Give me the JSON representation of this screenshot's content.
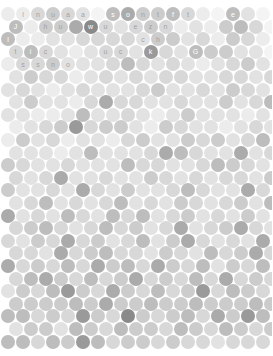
{
  "canvas": {
    "width": 272,
    "height": 356,
    "background": "#ffffff",
    "description": "hexagonal-packed grid of grey circles with faint letters in upper rows"
  },
  "grid": {
    "cell_diameter": 14,
    "pitch_x": 15,
    "pitch_y": 12.6,
    "row_offset_x": 7.5,
    "origin_x": 8,
    "origin_y": 14,
    "rows": 27,
    "cols": 18
  },
  "palette": {
    "lightest": "#f2f2f2",
    "light": "#e4e4e4",
    "mid_light": "#d6d6d6",
    "mid": "#c4c4c4",
    "mid_dark": "#b0b0b0",
    "dark": "#9a9a9a",
    "darkest": "#808080",
    "label_light": "#ffffff",
    "label_dark": "#b8b8b8"
  },
  "chart_data": {
    "type": "heatmap",
    "title": "",
    "xlabel": "",
    "ylabel": "",
    "legend": [],
    "grid": false,
    "value_scale": [
      0,
      9
    ],
    "rows": [
      {
        "index": 0,
        "offset": false,
        "values": [
          1,
          1,
          3,
          4,
          3,
          2,
          0,
          5,
          6,
          4,
          4,
          5,
          3,
          1,
          0,
          5,
          2,
          0
        ],
        "letters": [
          "",
          "l",
          "n",
          "u",
          "a",
          "a",
          "",
          "s",
          "o",
          "n",
          "t",
          "f",
          "t",
          "",
          "",
          "e",
          "",
          ""
        ]
      },
      {
        "index": 1,
        "offset": true,
        "values": [
          5,
          1,
          4,
          4,
          6,
          8,
          3,
          2,
          3,
          4,
          3,
          1,
          2,
          1,
          4,
          5,
          3,
          0
        ],
        "letters": [
          "J",
          "",
          "h",
          "u",
          "",
          "w",
          "u",
          "",
          "e",
          "z",
          "n",
          "",
          "",
          "",
          "",
          "",
          "",
          ""
        ]
      },
      {
        "index": 2,
        "offset": false,
        "values": [
          5,
          1,
          1,
          2,
          2,
          3,
          3,
          3,
          3,
          2,
          4,
          4,
          2,
          3,
          1,
          4,
          3,
          1
        ],
        "letters": [
          "l",
          "",
          "",
          "",
          "",
          "",
          "",
          "",
          "",
          "c",
          "h",
          "",
          "",
          "",
          "",
          "",
          "",
          ""
        ]
      },
      {
        "index": 3,
        "offset": true,
        "values": [
          3,
          5,
          3,
          2,
          1,
          2,
          3,
          3,
          2,
          7,
          3,
          2,
          5,
          4,
          4,
          2,
          2,
          0
        ],
        "letters": [
          "t",
          "i",
          "c",
          "",
          "",
          "",
          "u",
          "c",
          "",
          "k",
          "",
          "",
          "G",
          "",
          "",
          "",
          "",
          ""
        ]
      },
      {
        "index": 4,
        "offset": false,
        "values": [
          1,
          3,
          3,
          4,
          2,
          2,
          2,
          3,
          5,
          3,
          2,
          3,
          2,
          1,
          2,
          3,
          4,
          2
        ],
        "letters": [
          "",
          "s",
          "s",
          "n",
          "o",
          "",
          "",
          "",
          "",
          "",
          "",
          "",
          "",
          "",
          "",
          "",
          "",
          ""
        ]
      },
      {
        "index": 5,
        "offset": true,
        "values": [
          2,
          4,
          3,
          3,
          1,
          2,
          3,
          2,
          3,
          2,
          3,
          3,
          2,
          2,
          3,
          3,
          2,
          3
        ],
        "letters": [
          "",
          "",
          "",
          "",
          "",
          "",
          "",
          "",
          "",
          "",
          "",
          "",
          "",
          "",
          "",
          "",
          "",
          ""
        ]
      },
      {
        "index": 6,
        "offset": false,
        "values": [
          2,
          3,
          2,
          1,
          2,
          3,
          2,
          2,
          2,
          3,
          4,
          2,
          2,
          3,
          2,
          4,
          3,
          2
        ],
        "letters": [
          "",
          "",
          "",
          "",
          "",
          "",
          "",
          "",
          "",
          "",
          "",
          "",
          "",
          "",
          "",
          "",
          "",
          ""
        ]
      },
      {
        "index": 7,
        "offset": true,
        "values": [
          2,
          4,
          2,
          2,
          1,
          3,
          6,
          3,
          3,
          2,
          2,
          3,
          2,
          2,
          4,
          2,
          3,
          5
        ],
        "letters": [
          "",
          "",
          "",
          "",
          "",
          "",
          "",
          "",
          "",
          "",
          "",
          "",
          "",
          "",
          "",
          "",
          "",
          ""
        ]
      },
      {
        "index": 8,
        "offset": false,
        "values": [
          2,
          2,
          1,
          1,
          2,
          5,
          2,
          2,
          3,
          2,
          1,
          2,
          4,
          2,
          2,
          2,
          1,
          2
        ],
        "letters": [
          "",
          "",
          "",
          "",
          "",
          "",
          "",
          "",
          "",
          "",
          "",
          "",
          "",
          "",
          "",
          "",
          "",
          ""
        ]
      },
      {
        "index": 9,
        "offset": true,
        "values": [
          1,
          2,
          3,
          4,
          7,
          3,
          4,
          4,
          2,
          1,
          4,
          3,
          2,
          2,
          1,
          2,
          3,
          2
        ],
        "letters": [
          "",
          "",
          "",
          "",
          "",
          "",
          "",
          "",
          "",
          "",
          "",
          "",
          "",
          "",
          "",
          "",
          "",
          ""
        ]
      },
      {
        "index": 10,
        "offset": false,
        "values": [
          1,
          4,
          2,
          3,
          1,
          2,
          2,
          1,
          3,
          4,
          2,
          2,
          4,
          3,
          4,
          2,
          3,
          5
        ],
        "letters": [
          "",
          "",
          "",
          "",
          "",
          "",
          "",
          "",
          "",
          "",
          "",
          "",
          "",
          "",
          "",
          "",
          "",
          ""
        ]
      },
      {
        "index": 11,
        "offset": true,
        "values": [
          2,
          2,
          2,
          1,
          2,
          5,
          2,
          2,
          2,
          3,
          6,
          5,
          3,
          2,
          2,
          6,
          2,
          3
        ],
        "letters": [
          "",
          "",
          "",
          "",
          "",
          "",
          "",
          "",
          "",
          "",
          "",
          "",
          "",
          "",
          "",
          "",
          "",
          ""
        ]
      },
      {
        "index": 12,
        "offset": false,
        "values": [
          4,
          3,
          2,
          2,
          3,
          2,
          2,
          2,
          5,
          3,
          3,
          2,
          2,
          3,
          5,
          4,
          3,
          2
        ],
        "letters": [
          "",
          "",
          "",
          "",
          "",
          "",
          "",
          "",
          "",
          "",
          "",
          "",
          "",
          "",
          "",
          "",
          "",
          ""
        ]
      },
      {
        "index": 13,
        "offset": true,
        "values": [
          3,
          2,
          3,
          6,
          2,
          2,
          3,
          2,
          2,
          4,
          3,
          2,
          3,
          2,
          3,
          3,
          2,
          4
        ],
        "letters": [
          "",
          "",
          "",
          "",
          "",
          "",
          "",
          "",
          "",
          "",
          "",
          "",
          "",
          "",
          "",
          "",
          "",
          ""
        ]
      },
      {
        "index": 14,
        "offset": false,
        "values": [
          4,
          2,
          2,
          3,
          2,
          6,
          3,
          2,
          4,
          2,
          2,
          3,
          5,
          3,
          2,
          2,
          6,
          3
        ],
        "letters": [
          "",
          "",
          "",
          "",
          "",
          "",
          "",
          "",
          "",
          "",
          "",
          "",
          "",
          "",
          "",
          "",
          "",
          ""
        ]
      },
      {
        "index": 15,
        "offset": true,
        "values": [
          2,
          3,
          5,
          2,
          3,
          2,
          3,
          5,
          2,
          3,
          2,
          4,
          3,
          2,
          3,
          4,
          2,
          5
        ],
        "letters": [
          "",
          "",
          "",
          "",
          "",
          "",
          "",
          "",
          "",
          "",
          "",
          "",
          "",
          "",
          "",
          "",
          "",
          ""
        ]
      },
      {
        "index": 16,
        "offset": false,
        "values": [
          6,
          2,
          3,
          2,
          5,
          3,
          2,
          5,
          3,
          5,
          2,
          3,
          4,
          2,
          3,
          2,
          4,
          2
        ],
        "letters": [
          "",
          "",
          "",
          "",
          "",
          "",
          "",
          "",
          "",
          "",
          "",
          "",
          "",
          "",
          "",
          "",
          "",
          ""
        ]
      },
      {
        "index": 17,
        "offset": true,
        "values": [
          3,
          4,
          5,
          3,
          2,
          3,
          5,
          3,
          4,
          2,
          3,
          6,
          2,
          3,
          4,
          6,
          3,
          2
        ],
        "letters": [
          "",
          "",
          "",
          "",
          "",
          "",
          "",
          "",
          "",
          "",
          "",
          "",
          "",
          "",
          "",
          "",
          "",
          ""
        ]
      },
      {
        "index": 18,
        "offset": false,
        "values": [
          3,
          2,
          4,
          3,
          6,
          3,
          4,
          2,
          3,
          5,
          2,
          4,
          6,
          3,
          2,
          3,
          2,
          6
        ],
        "letters": [
          "",
          "",
          "",
          "",
          "",
          "",
          "",
          "",
          "",
          "",
          "",
          "",
          "",
          "",
          "",
          "",
          "",
          ""
        ]
      },
      {
        "index": 19,
        "offset": true,
        "values": [
          3,
          3,
          2,
          6,
          3,
          4,
          5,
          3,
          3,
          2,
          4,
          3,
          2,
          5,
          3,
          4,
          6,
          3
        ],
        "letters": [
          "",
          "",
          "",
          "",
          "",
          "",
          "",
          "",
          "",
          "",
          "",
          "",
          "",
          "",
          "",
          "",
          "",
          ""
        ]
      },
      {
        "index": 20,
        "offset": false,
        "values": [
          6,
          3,
          4,
          3,
          5,
          3,
          6,
          4,
          5,
          3,
          6,
          4,
          3,
          5,
          2,
          4,
          3,
          5
        ],
        "letters": [
          "",
          "",
          "",
          "",
          "",
          "",
          "",
          "",
          "",
          "",
          "",
          "",
          "",
          "",
          "",
          "",
          "",
          ""
        ]
      },
      {
        "index": 21,
        "offset": true,
        "values": [
          3,
          5,
          6,
          4,
          3,
          5,
          3,
          4,
          6,
          3,
          4,
          3,
          5,
          3,
          6,
          3,
          4,
          3
        ],
        "letters": [
          "",
          "",
          "",
          "",
          "",
          "",
          "",
          "",
          "",
          "",
          "",
          "",
          "",
          "",
          "",
          "",
          "",
          ""
        ]
      },
      {
        "index": 22,
        "offset": false,
        "values": [
          2,
          4,
          3,
          5,
          7,
          4,
          3,
          6,
          4,
          3,
          5,
          3,
          4,
          7,
          3,
          5,
          4,
          3
        ],
        "letters": [
          "",
          "",
          "",
          "",
          "",
          "",
          "",
          "",
          "",
          "",
          "",
          "",
          "",
          "",
          "",
          "",
          "",
          ""
        ]
      },
      {
        "index": 23,
        "offset": true,
        "values": [
          4,
          4,
          4,
          4,
          5,
          4,
          6,
          4,
          4,
          5,
          4,
          4,
          5,
          4,
          4,
          4,
          5,
          4
        ],
        "letters": [
          "",
          "",
          "",
          "",
          "",
          "",
          "",
          "",
          "",
          "",
          "",
          "",
          "",
          "",
          "",
          "",
          "",
          ""
        ]
      },
      {
        "index": 24,
        "offset": false,
        "values": [
          5,
          5,
          3,
          4,
          3,
          7,
          4,
          3,
          8,
          4,
          3,
          4,
          5,
          3,
          6,
          4,
          7,
          5
        ],
        "letters": [
          "",
          "",
          "",
          "",
          "",
          "",
          "",
          "",
          "",
          "",
          "",
          "",
          "",
          "",
          "",
          "",
          "",
          ""
        ]
      },
      {
        "index": 25,
        "offset": true,
        "values": [
          2,
          4,
          4,
          2,
          5,
          4,
          3,
          5,
          4,
          4,
          3,
          5,
          4,
          3,
          5,
          4,
          3,
          4
        ],
        "letters": [
          "",
          "",
          "",
          "",
          "",
          "",
          "",
          "",
          "",
          "",
          "",
          "",
          "",
          "",
          "",
          "",
          "",
          ""
        ]
      },
      {
        "index": 26,
        "offset": false,
        "values": [
          5,
          5,
          3,
          5,
          4,
          7,
          5,
          3,
          4,
          4,
          3,
          4,
          3,
          3,
          2,
          3,
          3,
          3
        ],
        "letters": [
          "",
          "",
          "",
          "",
          "",
          "",
          "",
          "",
          "",
          "",
          "",
          "",
          "",
          "",
          "",
          "",
          "",
          ""
        ]
      }
    ]
  }
}
